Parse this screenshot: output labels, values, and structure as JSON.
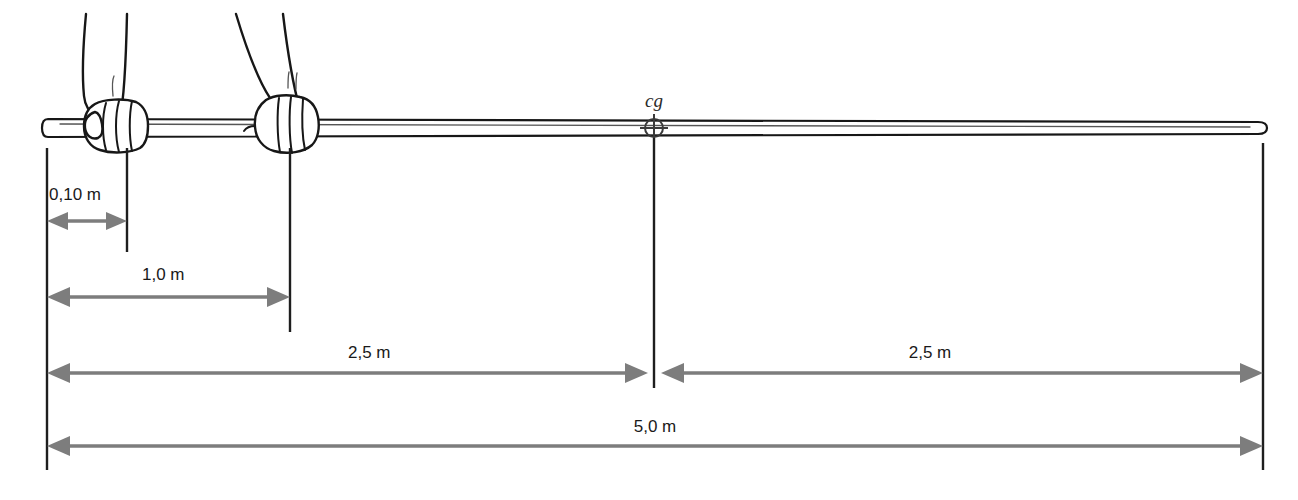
{
  "diagram": {
    "cg_label": "cg",
    "colors": {
      "dimension_gray": "#7d7d7d",
      "line_black": "#1e1e1e",
      "text": "#1a1a1a",
      "background": "#ffffff"
    },
    "dimensions": [
      {
        "id": "hand-offset",
        "label": "0,10 m",
        "value": 0.1,
        "unit": "m",
        "arrow_style": "double",
        "from": "pole-left-end",
        "to": "first-hand"
      },
      {
        "id": "hand-spacing",
        "label": "1,0 m",
        "value": 1.0,
        "unit": "m",
        "arrow_style": "double",
        "from": "pole-left-end",
        "to": "second-hand"
      },
      {
        "id": "left-half",
        "label": "2,5 m",
        "value": 2.5,
        "unit": "m",
        "arrow_style": "double",
        "from": "pole-left-end",
        "to": "center-of-gravity"
      },
      {
        "id": "right-half",
        "label": "2,5 m",
        "value": 2.5,
        "unit": "m",
        "arrow_style": "double",
        "from": "center-of-gravity",
        "to": "pole-right-end"
      },
      {
        "id": "total-length",
        "label": "5,0 m",
        "value": 5.0,
        "unit": "m",
        "arrow_style": "double",
        "from": "pole-left-end",
        "to": "pole-right-end"
      }
    ],
    "markers": {
      "center_of_gravity": {
        "label": "cg",
        "symbol": "crosshair-circle"
      }
    },
    "hands": [
      {
        "id": "hand-rear",
        "grip": "closed-fist"
      },
      {
        "id": "hand-front",
        "grip": "open-fingers"
      }
    ]
  }
}
